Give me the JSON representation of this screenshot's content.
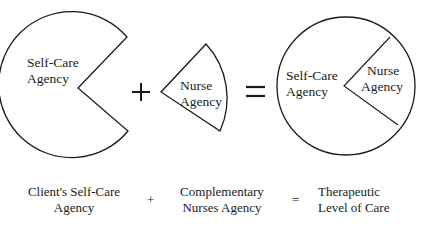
{
  "shapes": {
    "self_care": {
      "line1": "Self-Care",
      "line2": "Agency"
    },
    "nurse": {
      "line1": "Nurse",
      "line2": "Agency"
    },
    "combined": {
      "self_care": {
        "line1": "Self-Care",
        "line2": "Agency"
      },
      "nurse": {
        "line1": "Nurse",
        "line2": "Agency"
      }
    }
  },
  "operators": {
    "plus": "+",
    "equals": "="
  },
  "captions": {
    "client": {
      "line1": "Client's Self-Care",
      "line2": "Agency"
    },
    "plus": "+",
    "complementary": {
      "line1": "Complementary",
      "line2": "Nurses Agency"
    },
    "equals": "=",
    "therapeutic": {
      "line1": "Therapeutic",
      "line2": "Level of Care"
    }
  },
  "colors": {
    "stroke": "#1a1a1a",
    "background": "#ffffff"
  }
}
